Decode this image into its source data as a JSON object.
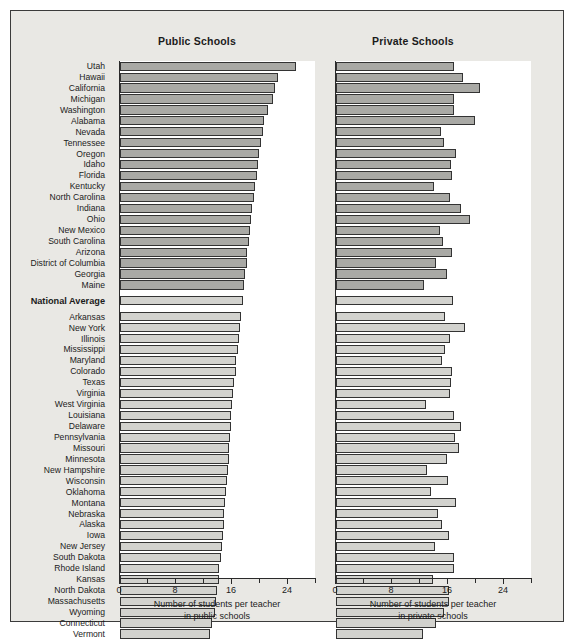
{
  "panels": {
    "public": {
      "title": "Public Schools",
      "axis_label_line1": "Number of students per teacher",
      "axis_label_line2": "in public schools"
    },
    "private": {
      "title": "Private Schools",
      "axis_label_line1": "Number of students per teacher",
      "axis_label_line2": "in private schools"
    }
  },
  "axis": {
    "ticks": [
      0,
      8,
      16,
      24
    ],
    "tick_labels": [
      "0",
      "8",
      "16",
      "24"
    ],
    "minor_ticks": [
      4,
      12,
      20,
      28
    ],
    "min": 0,
    "max": 28
  },
  "colors": {
    "above_average": "#a9a9a5",
    "below_average": "#d2d2ce",
    "outline": "#333333",
    "background": "#e9e8e4",
    "plot_background": "#ffffff"
  },
  "national_average_label": "National Average",
  "chart_data": {
    "type": "bar",
    "orientation": "horizontal",
    "xlabel": "Number of students per teacher",
    "ylabel": "",
    "xlim": [
      0,
      28
    ],
    "grid": false,
    "legend": "none",
    "categories": [
      "Utah",
      "Hawaii",
      "California",
      "Michigan",
      "Washington",
      "Alabama",
      "Nevada",
      "Tennessee",
      "Oregon",
      "Idaho",
      "Florida",
      "Kentucky",
      "North Carolina",
      "Indiana",
      "Ohio",
      "New Mexico",
      "South Carolina",
      "Arizona",
      "District of Columbia",
      "Georgia",
      "Maine",
      "National Average",
      "Arkansas",
      "New York",
      "Illinois",
      "Mississippi",
      "Maryland",
      "Colorado",
      "Texas",
      "Virginia",
      "West Virginia",
      "Louisiana",
      "Delaware",
      "Pennsylvania",
      "Missouri",
      "Minnesota",
      "New Hampshire",
      "Wisconsin",
      "Oklahoma",
      "Montana",
      "Nebraska",
      "Alaska",
      "Iowa",
      "New Jersey",
      "South Dakota",
      "Rhode Island",
      "Kansas",
      "North Dakota",
      "Massachusetts",
      "Wyoming",
      "Connecticut",
      "Vermont"
    ],
    "series": [
      {
        "name": "Public Schools",
        "values": [
          25.1,
          22.6,
          22.2,
          21.9,
          21.1,
          20.6,
          20.4,
          20.1,
          19.9,
          19.7,
          19.5,
          19.3,
          19.1,
          18.9,
          18.7,
          18.6,
          18.4,
          18.2,
          18.1,
          17.9,
          17.7,
          17.5,
          17.3,
          17.1,
          17.0,
          16.8,
          16.6,
          16.5,
          16.3,
          16.1,
          16.0,
          15.9,
          15.8,
          15.7,
          15.6,
          15.5,
          15.4,
          15.3,
          15.2,
          15.0,
          14.9,
          14.8,
          14.7,
          14.5,
          14.4,
          14.2,
          14.1,
          13.9,
          13.7,
          13.5,
          13.2,
          12.8
        ]
      },
      {
        "name": "Private Schools",
        "values": [
          16.9,
          18.2,
          20.5,
          16.9,
          16.8,
          19.8,
          15.0,
          15.4,
          17.2,
          16.4,
          16.5,
          14.0,
          16.3,
          17.8,
          19.1,
          14.8,
          15.3,
          16.5,
          14.3,
          15.8,
          12.5,
          16.7,
          15.6,
          18.4,
          16.3,
          15.5,
          15.1,
          16.6,
          16.4,
          16.3,
          12.8,
          16.9,
          17.9,
          17.0,
          17.5,
          15.9,
          13.0,
          16.0,
          13.6,
          17.2,
          14.6,
          15.1,
          16.1,
          14.2,
          16.9,
          16.8,
          13.8,
          16.2,
          16.1,
          15.4,
          14.3,
          12.4
        ]
      }
    ]
  }
}
